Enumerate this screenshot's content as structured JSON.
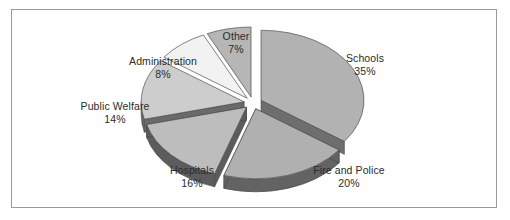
{
  "figure": {
    "border_color": "#9a9a9a",
    "background": "#ffffff",
    "text_color": "#2b2b2b"
  },
  "chart_data": {
    "type": "pie",
    "title": "",
    "subtitle": "",
    "xlabel": "",
    "ylabel": "",
    "exploded": true,
    "three_d": true,
    "legend": "none",
    "labels_position": "outside",
    "grid": false,
    "categories": [
      "Schools",
      "Fire and Police",
      "Hospitals",
      "Public Welfare",
      "Administration",
      "Other"
    ],
    "values": [
      35,
      20,
      16,
      14,
      8,
      7
    ],
    "value_suffix": "%",
    "slices": [
      {
        "label": "Schools",
        "percent": 35,
        "percent_text": "35%",
        "top_color": "#b2b2b2",
        "side_color": "#6e6e6e",
        "start_deg": 270,
        "end_deg": 396
      },
      {
        "label": "Fire and Police",
        "percent": 20,
        "percent_text": "20%",
        "top_color": "#b0b0b0",
        "side_color": "#636363",
        "start_deg": 36,
        "end_deg": 108
      },
      {
        "label": "Hospitals",
        "percent": 16,
        "percent_text": "16%",
        "top_color": "#bdbdbd",
        "side_color": "#5c5c5c",
        "start_deg": 108,
        "end_deg": 165.6
      },
      {
        "label": "Public Welfare",
        "percent": 14,
        "percent_text": "14%",
        "top_color": "#cdcdcd",
        "side_color": "#6a6a6a",
        "start_deg": 165.6,
        "end_deg": 216
      },
      {
        "label": "Administration",
        "percent": 8,
        "percent_text": "8%",
        "top_color": "#f2f2f2",
        "side_color": "#7a7a7a",
        "start_deg": 216,
        "end_deg": 244.8
      },
      {
        "label": "Other",
        "percent": 7,
        "percent_text": "7%",
        "top_color": "#b6b6b6",
        "side_color": "#676767",
        "start_deg": 244.8,
        "end_deg": 270
      }
    ]
  }
}
